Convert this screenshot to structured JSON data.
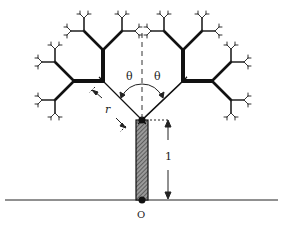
{
  "diagram": {
    "type": "fractal-tree",
    "labels": {
      "angle_left": "θ",
      "angle_right": "θ",
      "branch_length": "r",
      "trunk_length": "1",
      "origin": "O"
    },
    "colors": {
      "ink": "#111111",
      "hatch": "#555555",
      "background": "#ffffff"
    }
  }
}
